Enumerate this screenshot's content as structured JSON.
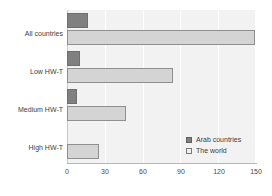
{
  "chart_data": {
    "type": "bar",
    "orientation": "horizontal",
    "title": "",
    "subtitle": "",
    "xlabel": "",
    "ylabel": "",
    "categories": [
      "All countries",
      "Low HW-T",
      "Medium HW-T",
      "High HW-T"
    ],
    "series": [
      {
        "name": "Arab countries",
        "color": "#808080",
        "values": [
          17,
          10,
          8,
          0
        ]
      },
      {
        "name": "The world",
        "color": "#d4d4d4",
        "values": [
          149,
          84,
          47,
          25
        ]
      }
    ],
    "xlim": [
      0,
      150
    ],
    "xticks": [
      0,
      30,
      60,
      90,
      120,
      150
    ],
    "xticklabels": [
      "0",
      "30",
      "60",
      "90",
      "120",
      "150"
    ],
    "grid": true,
    "grid_axis": "x",
    "legend_position": "inside-bottom-right",
    "plot_background": "#f2f2f2"
  },
  "legend": {
    "entries": [
      {
        "label": "Arab countries",
        "swatch": "filled-dark-square-icon"
      },
      {
        "label": "The world",
        "swatch": "outlined-light-square-icon"
      }
    ]
  }
}
